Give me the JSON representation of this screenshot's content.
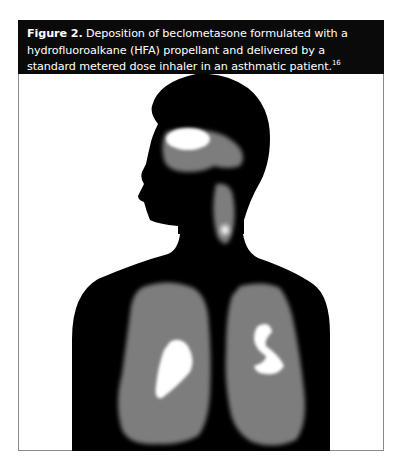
{
  "figure": {
    "label": "Figure 2.",
    "caption_text": " Deposition of beclometasone formulated with a hydrofluoroalkane (HFA) propellant and delivered by a standard metered dose inhaler in an asthmatic patient.",
    "reference": "16"
  },
  "image": {
    "description": "Gamma scintigraphy silhouette of a human head and torso showing drug deposition",
    "colors": {
      "background": "#000000",
      "moderate_deposition": "#7d7d7d",
      "high_deposition": "#ffffff"
    },
    "regions": [
      "oropharynx",
      "trachea",
      "left-lung",
      "right-lung"
    ]
  }
}
